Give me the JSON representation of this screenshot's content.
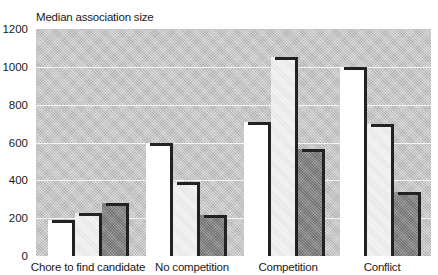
{
  "chart_data": {
    "type": "bar",
    "title": "",
    "ylabel": "Median association size",
    "xlabel": "",
    "ylim": [
      0,
      1200
    ],
    "yticks": [
      0,
      200,
      400,
      600,
      800,
      1000,
      1200
    ],
    "grid": true,
    "legend": null,
    "categories": [
      "Chore to find candidate",
      "No competition",
      "Competition",
      "Conflict"
    ],
    "series": [
      {
        "name": "Series 1 (white)",
        "color": "#ffffff",
        "values": [
          190,
          600,
          710,
          1000
        ]
      },
      {
        "name": "Series 2 (light gray)",
        "color": "#e6e6e6",
        "values": [
          230,
          390,
          1050,
          700
        ]
      },
      {
        "name": "Series 3 (dark gray)",
        "color": "#8e8e8e",
        "values": [
          280,
          215,
          565,
          340
        ]
      }
    ]
  },
  "labels": {
    "ylabel": "Median association size",
    "ticks": [
      "0",
      "200",
      "400",
      "600",
      "800",
      "1000",
      "1200"
    ],
    "categories": [
      "Chore to find candidate",
      "No competition",
      "Competition",
      "Conflict"
    ]
  }
}
